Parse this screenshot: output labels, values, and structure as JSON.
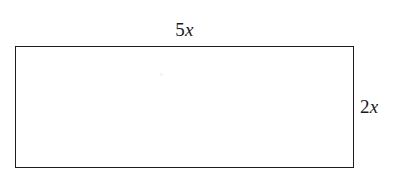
{
  "figure": {
    "type": "geometry-diagram",
    "shape": "rectangle",
    "background_color": "#ffffff",
    "stroke_color": "#1c1c1c",
    "text_color": "#1a1a1a",
    "labels": {
      "top": {
        "text": "5x",
        "coefficient": "5",
        "variable": "x",
        "position": "above-top-edge",
        "describes": "width"
      },
      "right": {
        "text": "2x",
        "coefficient": "2",
        "variable": "x",
        "position": "right-of-right-edge",
        "describes": "height"
      }
    }
  },
  "chart_data": {
    "type": "diagram",
    "title": "",
    "shape": "rectangle",
    "dimensions": [
      {
        "side": "top",
        "label": "5x",
        "value": 5,
        "unit": "x"
      },
      {
        "side": "right",
        "label": "2x",
        "value": 2,
        "unit": "x"
      }
    ]
  }
}
